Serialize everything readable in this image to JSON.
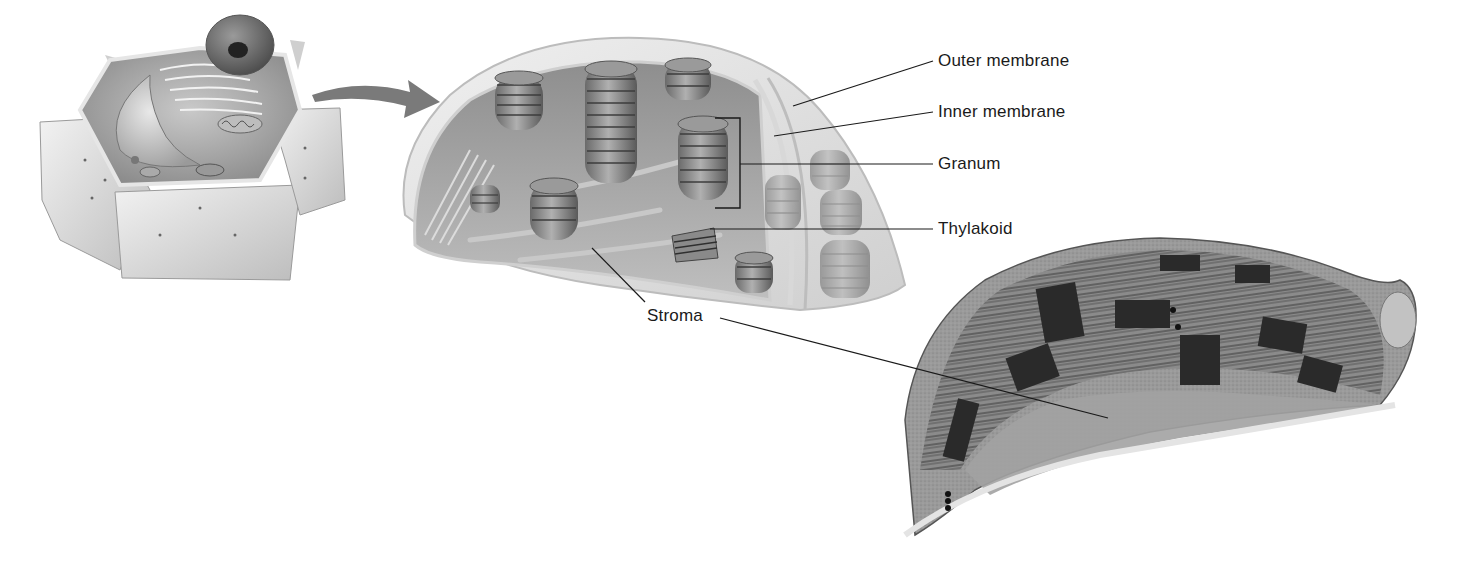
{
  "figure": {
    "panels": [
      {
        "id": "plant-cell",
        "description": "Cutaway plant cell illustration"
      },
      {
        "id": "chloroplast-illustration",
        "description": "Cutaway chloroplast illustration"
      },
      {
        "id": "chloroplast-micrograph",
        "description": "Electron micrograph of chloroplast"
      }
    ],
    "labels": [
      {
        "key": "outer_membrane",
        "text": "Outer membrane"
      },
      {
        "key": "inner_membrane",
        "text": "Inner membrane"
      },
      {
        "key": "granum",
        "text": "Granum"
      },
      {
        "key": "thylakoid",
        "text": "Thylakoid"
      },
      {
        "key": "stroma",
        "text": "Stroma"
      }
    ]
  },
  "colors": {
    "background": "#ffffff",
    "line": "#1a1a1a",
    "arrow": "#707070"
  }
}
